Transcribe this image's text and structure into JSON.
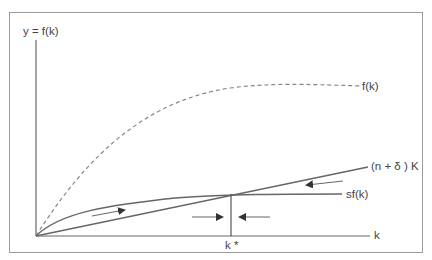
{
  "diagram": {
    "axes": {
      "y_label": "y  =  f(k)",
      "x_label": "k"
    },
    "curves": [
      {
        "id": "production",
        "label": "f(k)",
        "style": "dashed",
        "color": "#888888"
      },
      {
        "id": "savings",
        "label": "sf(k)",
        "style": "solid",
        "color": "#666666"
      },
      {
        "id": "break_even",
        "label": "(n + δ ) K",
        "style": "solid",
        "color": "#666666"
      }
    ],
    "steady_state": {
      "label": "k *"
    },
    "arrows": [
      {
        "id": "left-rising",
        "direction": "right"
      },
      {
        "id": "right-falling",
        "direction": "left"
      },
      {
        "id": "converge-left",
        "direction": "right"
      },
      {
        "id": "converge-right",
        "direction": "left"
      }
    ],
    "colors": {
      "frame": "#9a9a9a",
      "line": "#666666",
      "dashed": "#888888",
      "text": "#444444"
    }
  }
}
